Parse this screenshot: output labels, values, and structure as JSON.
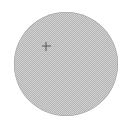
{
  "canvas": {
    "width": 129,
    "height": 132,
    "background_color": "#ffffff",
    "alt_text": "Circular textured sample disc with a small crosshair marker in the upper-left region"
  },
  "disc": {
    "name": "textured-disc",
    "shape": "circle",
    "center_x": 65.5,
    "center_y": 64,
    "radius": 52,
    "left": 13.5,
    "top": 12,
    "diameter": 104,
    "fill_style": "fine-dither-checkerboard",
    "fill_color_light": "#cfcfcf",
    "fill_color_dark": "#b6b6b6",
    "pattern_period_px": 2,
    "edge_color": "#a0a0a0"
  },
  "marker": {
    "name": "crosshair-marker",
    "symbol": "+",
    "center_x": 46,
    "center_y": 46,
    "size": 9,
    "stroke_width": 1,
    "color": "#565656",
    "label": "crosshair"
  }
}
